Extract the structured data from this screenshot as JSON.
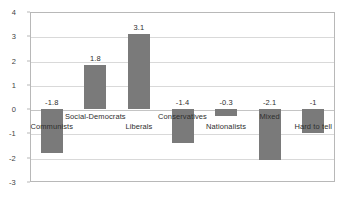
{
  "chart_data": {
    "type": "bar",
    "title": "",
    "subtitle": "",
    "xlabel": "",
    "ylabel": "",
    "categories": [
      "Communists",
      "Social-Democrats",
      "Liberals",
      "Conservatives",
      "Nationalists",
      "Mixed",
      "Hard to tell"
    ],
    "values": [
      -1.8,
      1.8,
      3.1,
      -1.4,
      -0.3,
      -2.1,
      -1
    ],
    "value_labels": [
      "-1.8",
      "1.8",
      "3.1",
      "-1.4",
      "-0.3",
      "-2.1",
      "-1"
    ],
    "ylim": [
      -3,
      4
    ],
    "yticks": [
      4,
      3,
      2,
      1,
      0,
      -1,
      -2,
      -3
    ],
    "ytick_labels": [
      "4",
      "3",
      "2",
      "1",
      "0",
      "-1",
      "-2",
      "-3"
    ],
    "grid": true,
    "legend": "none",
    "bar_color": "#7a7a7a",
    "grid_color": "#d9d9d9",
    "frame_color": "#b8b8b8",
    "text_color": "#2e2e2e"
  }
}
